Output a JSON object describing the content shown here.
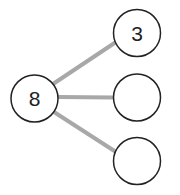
{
  "diagram": {
    "type": "number-bond",
    "whole": {
      "label": "8",
      "cx": 34.5,
      "cy": 98.5,
      "r": 23.5
    },
    "parts": [
      {
        "label": "3",
        "cx": 137,
        "cy": 33,
        "r": 23.5
      },
      {
        "label": "",
        "cx": 137,
        "cy": 97,
        "r": 23.5
      },
      {
        "label": "",
        "cx": 137,
        "cy": 161,
        "r": 23.5
      }
    ],
    "colors": {
      "stroke": "#222222",
      "connector": "#a8a8a8",
      "background": "#ffffff"
    }
  }
}
